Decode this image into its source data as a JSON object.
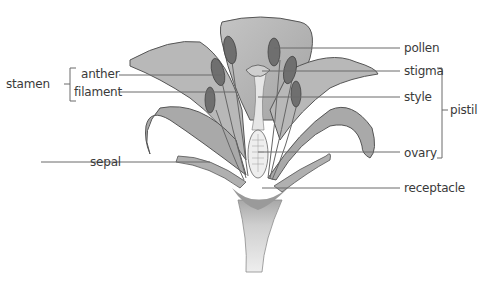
{
  "diagram": {
    "labels_left": [
      {
        "id": "anther",
        "text": "anther"
      },
      {
        "id": "filament",
        "text": "filament"
      },
      {
        "id": "sepal",
        "text": "sepal"
      }
    ],
    "group_left": {
      "id": "stamen",
      "text": "stamen",
      "members": [
        "anther",
        "filament"
      ]
    },
    "labels_right": [
      {
        "id": "pollen",
        "text": "pollen"
      },
      {
        "id": "stigma",
        "text": "stigma"
      },
      {
        "id": "style",
        "text": "style"
      },
      {
        "id": "ovary",
        "text": "ovary"
      },
      {
        "id": "receptacle",
        "text": "receptacle"
      }
    ],
    "group_right": {
      "id": "pistil",
      "text": "pistil",
      "members": [
        "stigma",
        "style",
        "ovary"
      ]
    },
    "colors": {
      "petal": "#b5b5b5",
      "petal_dark": "#8f8f8f",
      "outline": "#555555",
      "anther": "#6e6e6e",
      "stem": "#d2d2d2",
      "leader_line": "#6a6a6a",
      "text": "#3a3a3a"
    }
  }
}
